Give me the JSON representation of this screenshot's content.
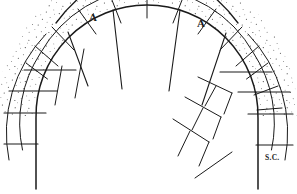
{
  "figure": {
    "type": "line-drawing",
    "width": 297,
    "height": 194,
    "background_color": "#ffffff",
    "ink_color": "#1a1a1a"
  },
  "labels": {
    "a_left": "A",
    "a_right": "A",
    "springing_course": "S.C."
  },
  "geometry": {
    "arch_center_x": 147,
    "arch_center_y": 116,
    "intrados_radius": 112,
    "extrados_radius_outer": 152,
    "ring_count": 3,
    "ring_radii": [
      112,
      128,
      142,
      152
    ],
    "left_pier_x": 36,
    "right_pier_x": 258,
    "pier_bottom_y": 189
  },
  "course_lines": {
    "left_side_y": [
      70,
      91,
      113,
      144
    ],
    "right_side_y": [
      72,
      92,
      114,
      145
    ],
    "left_x_extent": [
      8,
      52
    ],
    "right_x_extent": [
      244,
      290
    ]
  },
  "radiating_joints_deg": [
    118,
    142,
    156,
    168,
    180,
    192,
    204,
    215,
    226,
    238,
    250,
    262
  ],
  "extended_joint_rays_deg": [
    148,
    168,
    192,
    214
  ],
  "stipple": {
    "enabled": true,
    "density": "medium",
    "dot_color": "#2a2a2a",
    "description": "speckled masonry texture inside voussoir ring segments"
  }
}
